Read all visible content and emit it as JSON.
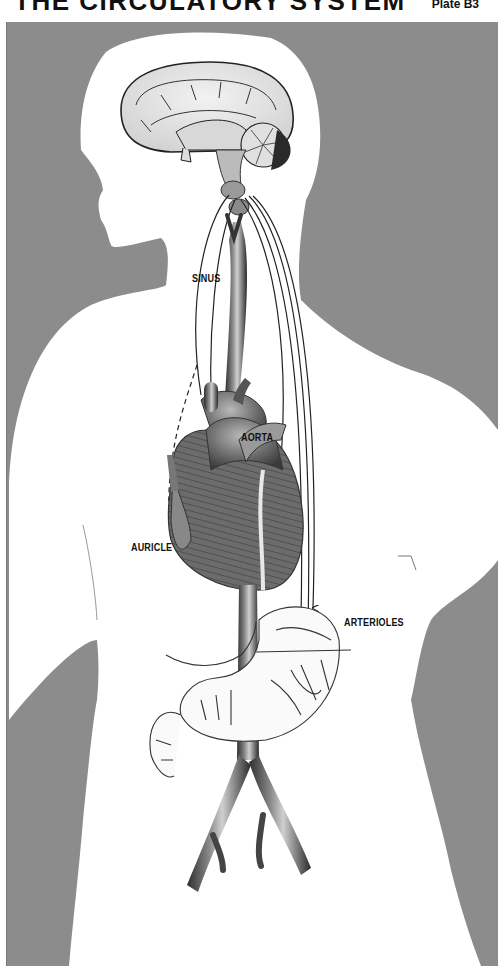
{
  "header": {
    "title": "THE CIRCULATORY SYSTEM",
    "plate": "Plate B3"
  },
  "colors": {
    "background_gray": "#8c8c8c",
    "silhouette": "#ffffff",
    "vessel_dark": "#3a3a3a",
    "vessel_mid": "#7a7a7a",
    "ink": "#111111"
  },
  "figure": {
    "labels": [
      {
        "id": "sinus",
        "text": "SINUS"
      },
      {
        "id": "aorta",
        "text": "AORTA"
      },
      {
        "id": "auricle",
        "text": "AURICLE"
      },
      {
        "id": "arterioles",
        "text": "ARTERIOLES"
      }
    ]
  }
}
